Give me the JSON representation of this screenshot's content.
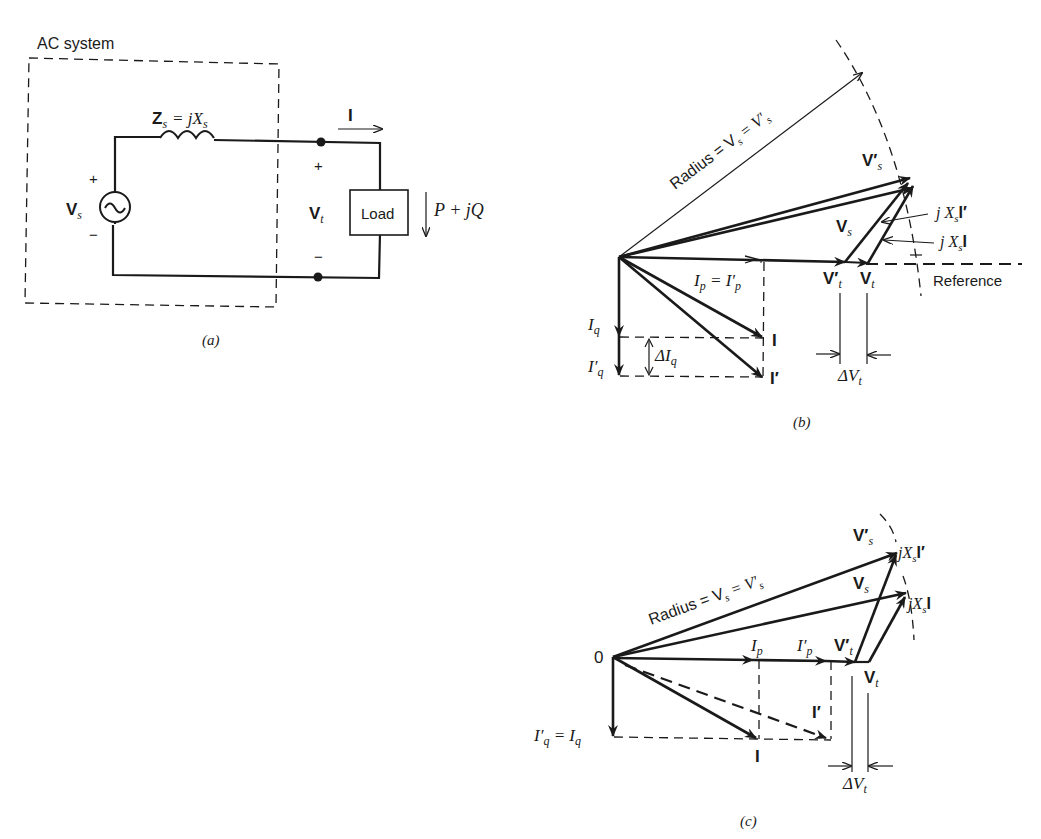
{
  "figure_a": {
    "system_label": "AC system",
    "impedance_label": "Z",
    "impedance_sub": "s",
    "impedance_eq": "= jX",
    "impedance_eq_sub": "s",
    "source_label": "V",
    "source_sub": "s",
    "plus": "+",
    "minus": "−",
    "terminal_label": "V",
    "terminal_sub": "t",
    "current_label": "I",
    "load_label": "Load",
    "power_label": "P + jQ",
    "caption": "(a)"
  },
  "figure_b": {
    "radius_label": "Radius = V",
    "radius_sub": "s",
    "radius_eq": " = V′",
    "radius_eq_sub": "s",
    "vs_prime": "V′",
    "vs": "V",
    "s": "s",
    "jxsi_prime": "j X",
    "jxsi_prime_tail": "I′",
    "jxsi": "j X",
    "jxsi_tail": "I",
    "vt_prime": "V′",
    "vt": "V",
    "t": "t",
    "reference": "Reference",
    "ip_label": "I",
    "p": "p",
    "ip_eq": " = I′",
    "iq_label": "I",
    "q": "q",
    "iq_prime_label": "I′",
    "delta_iq": "ΔI",
    "i_label": "I",
    "i_prime_label": "I′",
    "delta_vt": "ΔV",
    "caption": "(b)"
  },
  "figure_c": {
    "origin": "0",
    "radius_label": "Radius = V",
    "radius_sub": "s",
    "radius_eq": " = V′",
    "radius_eq_sub": "s",
    "vs_prime": "V′",
    "vs": "V",
    "s": "s",
    "jxsi_prime": "jX",
    "jxsi_prime_tail": "I′",
    "jxsi": "jX",
    "jxsi_tail": "I",
    "ip": "I",
    "ip_prime": "I′",
    "p": "p",
    "vt_prime": "V′",
    "vt": "V",
    "t": "t",
    "i_label": "I",
    "i_prime_label": "I′",
    "iq_eq": "I′",
    "q": "q",
    "iq_eq_rhs": " =  I",
    "delta_vt": "ΔV",
    "caption": "(c)"
  }
}
